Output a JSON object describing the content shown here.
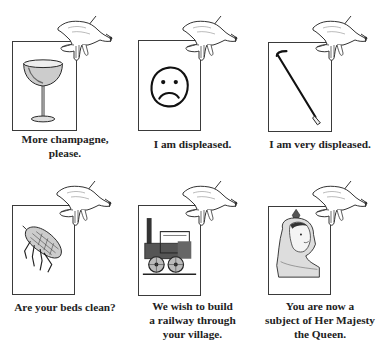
{
  "panels": [
    {
      "id": "champagne",
      "icon": "champagne-glass-icon",
      "caption_lines": [
        "More champagne,",
        "please."
      ]
    },
    {
      "id": "sad-face",
      "icon": "frowning-face-icon",
      "caption_lines": [
        "I am displeased."
      ]
    },
    {
      "id": "crowbar",
      "icon": "crowbar-icon",
      "caption_lines": [
        "I am very displeased."
      ]
    },
    {
      "id": "flea",
      "icon": "flea-icon",
      "caption_lines": [
        "Are your beds clean?"
      ]
    },
    {
      "id": "locomotive",
      "icon": "steam-locomotive-icon",
      "caption_lines": [
        "We wish to build",
        "a railway through",
        "your village."
      ]
    },
    {
      "id": "queen",
      "icon": "queen-victoria-portrait-icon",
      "caption_lines": [
        "You are now a",
        "subject of Her Majesty",
        "the Queen."
      ]
    }
  ],
  "colors": {
    "ink": "#222222",
    "frame": "#3a3a3a",
    "background": "#ffffff"
  }
}
